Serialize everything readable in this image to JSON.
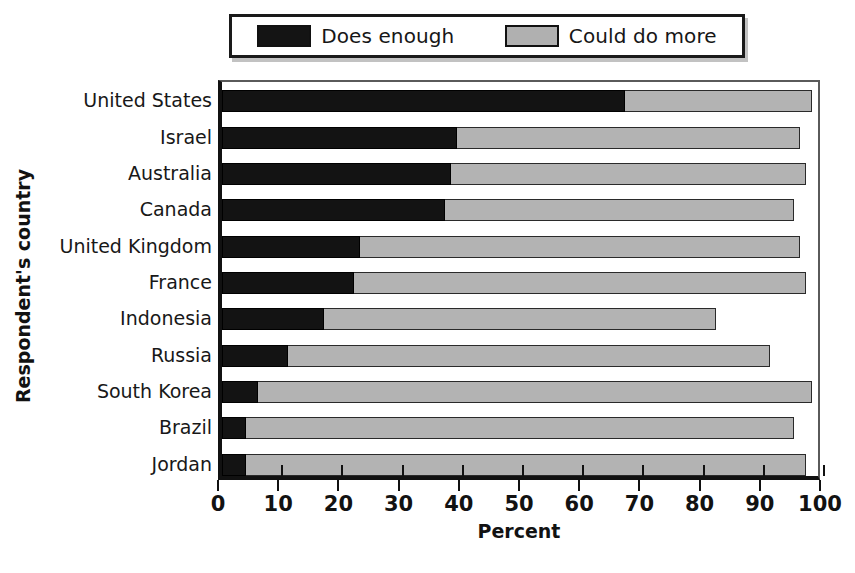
{
  "chart_data": {
    "type": "bar",
    "orientation": "horizontal",
    "stacked": true,
    "title": "",
    "xlabel": "Percent",
    "ylabel": "Respondent's country",
    "xlim": [
      0,
      100
    ],
    "xticks": [
      0,
      10,
      20,
      30,
      40,
      50,
      60,
      70,
      80,
      90,
      100
    ],
    "grid": false,
    "legend_position": "top",
    "categories": [
      "United States",
      "Israel",
      "Australia",
      "Canada",
      "United Kingdom",
      "France",
      "Indonesia",
      "Russia",
      "South Korea",
      "Brazil",
      "Jordan"
    ],
    "series": [
      {
        "name": "Does enough",
        "color": "#131313",
        "values": [
          67,
          39,
          38,
          37,
          23,
          22,
          17,
          11,
          6,
          4,
          4
        ]
      },
      {
        "name": "Could do more",
        "color": "#b3b3b3",
        "values": [
          31,
          57,
          59,
          58,
          73,
          75,
          65,
          80,
          92,
          91,
          93
        ]
      }
    ],
    "totals": [
      98,
      96,
      97,
      95,
      96,
      97,
      82,
      91,
      98,
      95,
      97
    ]
  },
  "legend": {
    "entries": [
      {
        "label": "Does enough",
        "swatch": "dark-swatch"
      },
      {
        "label": "Could do more",
        "swatch": "light-swatch"
      }
    ]
  },
  "axes": {
    "x_title": "Percent",
    "y_title": "Respondent's country",
    "x_tick_labels": [
      "0",
      "10",
      "20",
      "30",
      "40",
      "50",
      "60",
      "70",
      "80",
      "90",
      "100"
    ]
  }
}
